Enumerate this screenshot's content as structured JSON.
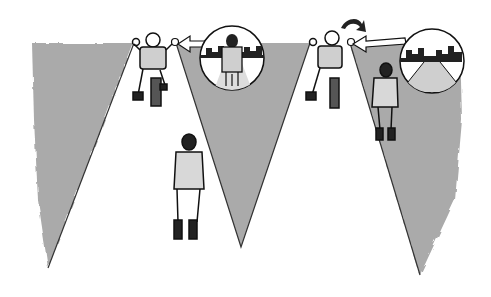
{
  "illustration": {
    "description": "Viewing cones of two motorcycle riders; inset circles show what each rider sees",
    "colors": {
      "cone": "#a9a9a9",
      "line": "#1a1a1a",
      "background": "#ffffff",
      "shirt": "#cfcfcf",
      "boot": "#222222"
    },
    "panels": [
      {
        "id": "left",
        "cones": 2,
        "rider": "rider looking left",
        "inset": "pedestrian seen ahead with buildings"
      },
      {
        "id": "right",
        "cones": 1,
        "rider": "rider turning head",
        "inset": "empty road with buildings"
      }
    ]
  }
}
